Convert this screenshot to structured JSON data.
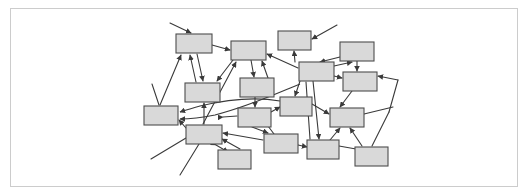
{
  "figure": {
    "kind": "node-link-diagram",
    "title": "",
    "caption": "",
    "frame": {
      "x": 10,
      "y": 8,
      "width": 508,
      "height": 179,
      "border_color": "#cccccc",
      "background_color": "#ffffff"
    },
    "style": {
      "node_fill": "#d9d9d9",
      "node_stroke": "#4d4d4d",
      "edge_color": "#3a3a3a",
      "node_stroke_width": 1.1,
      "edge_stroke_width": 1.1
    },
    "counts": {
      "nodes": 19,
      "edges": 34
    }
  },
  "chart_data": {
    "type": "diagram",
    "title": "",
    "xlabel": "",
    "ylabel": "",
    "nodes": [
      {
        "id": "n1",
        "label": "",
        "x": 176,
        "y": 34,
        "w": 36,
        "h": 19
      },
      {
        "id": "n2",
        "label": "",
        "x": 231,
        "y": 41,
        "w": 35,
        "h": 19
      },
      {
        "id": "n3",
        "label": "",
        "x": 278,
        "y": 31,
        "w": 33,
        "h": 19
      },
      {
        "id": "n4",
        "label": "",
        "x": 340,
        "y": 42,
        "w": 34,
        "h": 19
      },
      {
        "id": "n5",
        "label": "",
        "x": 299,
        "y": 62,
        "w": 35,
        "h": 19
      },
      {
        "id": "n6",
        "label": "",
        "x": 343,
        "y": 72,
        "w": 34,
        "h": 19
      },
      {
        "id": "n7",
        "label": "",
        "x": 185,
        "y": 83,
        "w": 35,
        "h": 19
      },
      {
        "id": "n8",
        "label": "",
        "x": 240,
        "y": 78,
        "w": 34,
        "h": 19
      },
      {
        "id": "n9",
        "label": "",
        "x": 144,
        "y": 106,
        "w": 34,
        "h": 19
      },
      {
        "id": "n10",
        "label": "",
        "x": 280,
        "y": 97,
        "w": 32,
        "h": 19
      },
      {
        "id": "n11",
        "label": "",
        "x": 238,
        "y": 108,
        "w": 33,
        "h": 19
      },
      {
        "id": "n12",
        "label": "",
        "x": 186,
        "y": 125,
        "w": 36,
        "h": 19
      },
      {
        "id": "n13",
        "label": "",
        "x": 330,
        "y": 108,
        "w": 34,
        "h": 19
      },
      {
        "id": "n14",
        "label": "",
        "x": 264,
        "y": 134,
        "w": 34,
        "h": 19
      },
      {
        "id": "n15",
        "label": "",
        "x": 218,
        "y": 150,
        "w": 33,
        "h": 19
      },
      {
        "id": "n16",
        "label": "",
        "x": 307,
        "y": 140,
        "w": 32,
        "h": 19
      },
      {
        "id": "n17",
        "label": "",
        "x": 355,
        "y": 147,
        "w": 33,
        "h": 19
      },
      {
        "id": "n18",
        "label": "",
        "x": 278,
        "y": 55,
        "w": 0,
        "h": 0
      },
      {
        "id": "n19",
        "label": "",
        "x": 0,
        "y": 0,
        "w": 0,
        "h": 0
      }
    ],
    "edges": [
      {
        "from": "external",
        "to": "n1",
        "arrow": "end"
      },
      {
        "from": "n7",
        "to": "n1",
        "arrow": "end"
      },
      {
        "from": "n9",
        "to": "n1",
        "arrow": "end"
      },
      {
        "from": "n1",
        "to": "n7",
        "arrow": "end"
      },
      {
        "from": "n2",
        "to": "n7",
        "arrow": "end"
      },
      {
        "from": "n12",
        "to": "n7",
        "arrow": "end"
      },
      {
        "from": "n1",
        "to": "n2",
        "arrow": "end"
      },
      {
        "from": "n2",
        "to": "n8",
        "arrow": "end"
      },
      {
        "from": "n5",
        "to": "n2",
        "arrow": "end"
      },
      {
        "from": "n12",
        "to": "n2",
        "arrow": "end"
      },
      {
        "from": "external",
        "to": "n3",
        "arrow": "end"
      },
      {
        "from": "n5",
        "to": "n3",
        "arrow": "end"
      },
      {
        "from": "n5",
        "to": "n4",
        "arrow": "end"
      },
      {
        "from": "n4",
        "to": "n6",
        "arrow": "end"
      },
      {
        "from": "n5",
        "to": "n6",
        "arrow": "end"
      },
      {
        "from": "n6",
        "to": "n5",
        "arrow": "end"
      },
      {
        "from": "external",
        "to": "n6",
        "arrow": "end"
      },
      {
        "from": "n8",
        "to": "n11",
        "arrow": "end"
      },
      {
        "from": "n9",
        "to": "n12",
        "arrow": "both"
      },
      {
        "from": "n10",
        "to": "n9",
        "arrow": "end"
      },
      {
        "from": "n12",
        "to": "n9",
        "arrow": "end"
      },
      {
        "from": "n11",
        "to": "n10",
        "arrow": "end"
      },
      {
        "from": "n10",
        "to": "n13",
        "arrow": "end"
      },
      {
        "from": "n13",
        "to": "n16",
        "arrow": "end"
      },
      {
        "from": "n5",
        "to": "n16",
        "arrow": "end"
      },
      {
        "from": "n16",
        "to": "n17",
        "arrow": "end"
      },
      {
        "from": "n14",
        "to": "n12",
        "arrow": "end"
      },
      {
        "from": "n14",
        "to": "n11",
        "arrow": "end"
      },
      {
        "from": "n12",
        "to": "n15",
        "arrow": "end"
      },
      {
        "from": "n15",
        "to": "n12",
        "arrow": "end"
      },
      {
        "from": "n14",
        "to": "n16",
        "arrow": "both"
      },
      {
        "from": "n16",
        "to": "n13",
        "arrow": "end"
      },
      {
        "from": "n17",
        "to": "n13",
        "arrow": "end"
      },
      {
        "from": "n9",
        "to": "external",
        "arrow": "none"
      }
    ]
  }
}
